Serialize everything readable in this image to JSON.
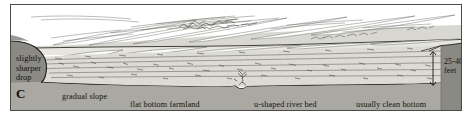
{
  "figure": {
    "panel_letter": "C",
    "type": "landscape cross-section diagram",
    "labels": {
      "sharper_drop_line1": "slightly",
      "sharper_drop_line2": "sharper",
      "sharper_drop_line3": "drop",
      "gradual_slope": "gradual slope",
      "flat_bottom_farmland": "flat bottom farmland",
      "u_shaped_river_bed": "u-shaped river bed",
      "usually_clean_bottom": "usually clean bottom",
      "depth_value": "25-40",
      "depth_unit": "feet"
    },
    "colors": {
      "page_background": "#ffffff",
      "frame_border": "#4a4a48",
      "cutaway_wall": "#8a8a86",
      "valley_fill": "#c9c8c2",
      "ground_line": "#23221d",
      "sky": "#ffffff",
      "text": "#15140f"
    },
    "measurement": {
      "quantity": "bank height",
      "range_low": 25,
      "range_high": 40,
      "unit": "feet",
      "annotation": "25-40 feet"
    }
  }
}
